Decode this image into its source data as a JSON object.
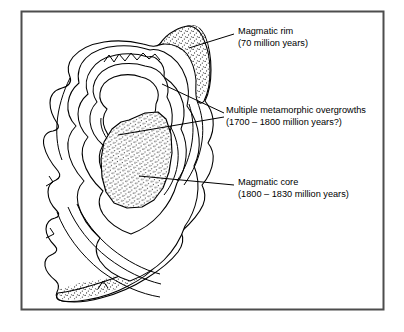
{
  "figure": {
    "name": "zircon-zoning-diagram",
    "background_color": "#ffffff",
    "border_color": "#4d4d4d",
    "line_color": "#000000",
    "stipple_color": "#1a1a1a"
  },
  "labels": [
    {
      "id": "magmatic-rim",
      "line1": "Magmatic rim",
      "line2": "(70 million years)",
      "text_x": 236,
      "text_y": 37,
      "leader": {
        "x1": 228,
        "y1": 34,
        "x2": 189,
        "y2": 48
      }
    },
    {
      "id": "metamorphic-overgrowths",
      "line1": "Multiple metamorphic overgrowths",
      "line2": "(1700 – 1800 million years?)",
      "text_x": 225,
      "text_y": 116,
      "leader_a": {
        "x1": 222,
        "y1": 113,
        "x2": 163,
        "y2": 84
      },
      "leader_b": {
        "x1": 222,
        "y1": 117,
        "x2": 120,
        "y2": 134
      }
    },
    {
      "id": "magmatic-core",
      "line1": "Magmatic core",
      "line2": "(1800 – 1830 million years)",
      "text_x": 236,
      "text_y": 187,
      "leader": {
        "x1": 228,
        "y1": 185,
        "x2": 140,
        "y2": 176
      }
    }
  ],
  "zones": [
    {
      "id": "outer-crystal-outline",
      "label": "outer crystal outline"
    },
    {
      "id": "magmatic-rim-band-top",
      "label": "stippled magmatic rim band (top)"
    },
    {
      "id": "magmatic-rim-band-bottom",
      "label": "stippled magmatic rim band (bottom)"
    },
    {
      "id": "overgrowth-zone-1",
      "label": "metamorphic overgrowth zone 1"
    },
    {
      "id": "overgrowth-zone-2",
      "label": "metamorphic overgrowth zone 2"
    },
    {
      "id": "overgrowth-zone-3",
      "label": "metamorphic overgrowth zone 3"
    },
    {
      "id": "overgrowth-zone-4",
      "label": "metamorphic overgrowth zone 4"
    },
    {
      "id": "magmatic-core-region",
      "label": "stippled magmatic core"
    }
  ]
}
